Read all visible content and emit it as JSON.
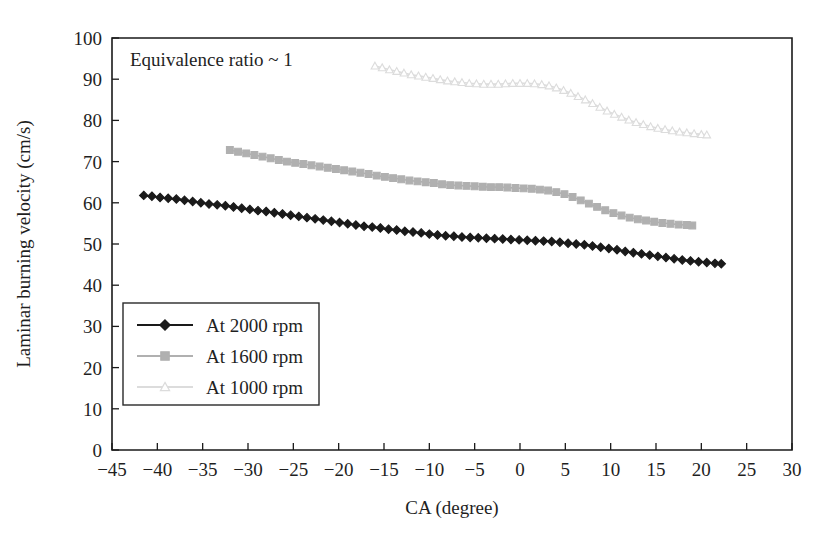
{
  "chart_data": {
    "type": "line",
    "title": "",
    "annotation": "Equivalence ratio ~ 1",
    "xlabel": "CA (degree)",
    "ylabel": "Laminar burning velocity (cm/s)",
    "xlim": [
      -45,
      30
    ],
    "ylim": [
      0,
      100
    ],
    "xticks": [
      -45,
      -40,
      -35,
      -30,
      -25,
      -20,
      -15,
      -10,
      -5,
      0,
      5,
      10,
      15,
      20,
      25,
      30
    ],
    "xtick_labels": [
      "−45",
      "−40",
      "−35",
      "−30",
      "−25",
      "−20",
      "−15",
      "−10",
      "−5",
      "0",
      "5",
      "10",
      "15",
      "20",
      "25",
      "30"
    ],
    "yticks": [
      0,
      10,
      20,
      30,
      40,
      50,
      60,
      70,
      80,
      90,
      100
    ],
    "ytick_labels": [
      "0",
      "10",
      "20",
      "30",
      "40",
      "50",
      "60",
      "70",
      "80",
      "90",
      "100"
    ],
    "grid": false,
    "legend_position": "lower-left",
    "series": [
      {
        "name": "At 2000 rpm",
        "color": "#1a1a1a",
        "marker": "diamond",
        "x": [
          -41.5,
          -40.6,
          -39.7,
          -38.8,
          -37.9,
          -37.0,
          -36.1,
          -35.2,
          -34.3,
          -33.4,
          -32.5,
          -31.6,
          -30.7,
          -29.8,
          -28.9,
          -28.0,
          -27.1,
          -26.2,
          -25.3,
          -24.4,
          -23.5,
          -22.6,
          -21.7,
          -20.8,
          -19.9,
          -19.0,
          -18.1,
          -17.2,
          -16.3,
          -15.4,
          -14.5,
          -13.6,
          -12.7,
          -11.8,
          -10.9,
          -10.0,
          -9.1,
          -8.2,
          -7.3,
          -6.4,
          -5.5,
          -4.6,
          -3.7,
          -2.8,
          -1.9,
          -1.0,
          -0.1,
          0.8,
          1.7,
          2.6,
          3.5,
          4.4,
          5.3,
          6.2,
          7.1,
          8.0,
          8.9,
          9.8,
          10.7,
          11.6,
          12.5,
          13.4,
          14.3,
          15.2,
          16.1,
          17.0,
          17.9,
          18.8,
          19.7,
          20.6,
          21.5,
          22.2
        ],
        "y": [
          61.8,
          61.6,
          61.3,
          61.1,
          60.9,
          60.6,
          60.3,
          60.0,
          59.7,
          59.5,
          59.3,
          59.0,
          58.7,
          58.4,
          58.1,
          57.9,
          57.6,
          57.3,
          57.0,
          56.7,
          56.4,
          56.1,
          55.8,
          55.5,
          55.2,
          54.9,
          54.6,
          54.3,
          54.1,
          53.9,
          53.6,
          53.4,
          53.1,
          52.9,
          52.7,
          52.4,
          52.2,
          52.0,
          51.9,
          51.7,
          51.6,
          51.5,
          51.4,
          51.3,
          51.2,
          51.1,
          51.0,
          50.9,
          50.8,
          50.7,
          50.6,
          50.4,
          50.2,
          50.0,
          49.8,
          49.5,
          49.2,
          48.9,
          48.6,
          48.2,
          47.9,
          47.6,
          47.3,
          47.0,
          46.7,
          46.4,
          46.1,
          45.9,
          45.7,
          45.5,
          45.3,
          45.2
        ]
      },
      {
        "name": "At 1600 rpm",
        "color": "#b0b0b0",
        "marker": "square",
        "x": [
          -32.0,
          -31.1,
          -30.2,
          -29.3,
          -28.4,
          -27.5,
          -26.6,
          -25.7,
          -24.8,
          -23.9,
          -23.0,
          -22.1,
          -21.2,
          -20.3,
          -19.4,
          -18.5,
          -17.6,
          -16.7,
          -15.8,
          -14.9,
          -14.0,
          -13.1,
          -12.2,
          -11.3,
          -10.4,
          -9.5,
          -8.6,
          -7.7,
          -6.8,
          -5.9,
          -5.0,
          -4.1,
          -3.2,
          -2.3,
          -1.4,
          -0.5,
          0.4,
          1.3,
          2.2,
          3.1,
          4.0,
          4.9,
          5.8,
          6.7,
          7.6,
          8.5,
          9.4,
          10.3,
          11.2,
          12.1,
          13.0,
          13.9,
          14.8,
          15.7,
          16.6,
          17.5,
          18.4,
          19.0
        ],
        "y": [
          72.8,
          72.4,
          72.0,
          71.6,
          71.2,
          70.8,
          70.4,
          70.0,
          69.7,
          69.4,
          69.1,
          68.8,
          68.5,
          68.2,
          67.9,
          67.6,
          67.3,
          67.0,
          66.6,
          66.3,
          66.0,
          65.7,
          65.4,
          65.2,
          65.0,
          64.8,
          64.5,
          64.3,
          64.2,
          64.1,
          64.0,
          63.9,
          63.8,
          63.8,
          63.7,
          63.6,
          63.5,
          63.4,
          63.2,
          63.0,
          62.6,
          62.1,
          61.4,
          60.6,
          59.8,
          59.0,
          58.2,
          57.5,
          56.9,
          56.4,
          56.0,
          55.7,
          55.4,
          55.1,
          54.9,
          54.7,
          54.6,
          54.5
        ]
      },
      {
        "name": "At 1000 rpm",
        "color": "#dcdcdc",
        "marker": "triangle",
        "x": [
          -16.0,
          -15.2,
          -14.4,
          -13.6,
          -12.8,
          -12.0,
          -11.2,
          -10.4,
          -9.6,
          -8.8,
          -8.0,
          -7.2,
          -6.4,
          -5.6,
          -4.8,
          -4.0,
          -3.2,
          -2.4,
          -1.6,
          -0.8,
          0.0,
          0.8,
          1.6,
          2.4,
          3.2,
          4.0,
          4.8,
          5.6,
          6.4,
          7.2,
          8.0,
          8.8,
          9.6,
          10.4,
          11.2,
          12.0,
          12.8,
          13.6,
          14.4,
          15.2,
          16.0,
          16.8,
          17.6,
          18.4,
          19.2,
          20.0,
          20.6
        ],
        "y": [
          93.2,
          92.8,
          92.3,
          91.9,
          91.5,
          91.1,
          90.8,
          90.5,
          90.2,
          89.9,
          89.6,
          89.4,
          89.2,
          89.0,
          88.9,
          88.8,
          88.8,
          88.8,
          88.9,
          89.0,
          89.0,
          89.0,
          88.9,
          88.7,
          88.4,
          87.9,
          87.3,
          86.6,
          85.8,
          85.0,
          84.1,
          83.2,
          82.3,
          81.5,
          80.8,
          80.1,
          79.5,
          79.0,
          78.5,
          78.1,
          77.8,
          77.5,
          77.2,
          77.0,
          76.8,
          76.6,
          76.5
        ]
      }
    ]
  },
  "legend": {
    "items": [
      {
        "label": "At 2000 rpm"
      },
      {
        "label": "At 1600 rpm"
      },
      {
        "label": "At 1000 rpm"
      }
    ]
  }
}
